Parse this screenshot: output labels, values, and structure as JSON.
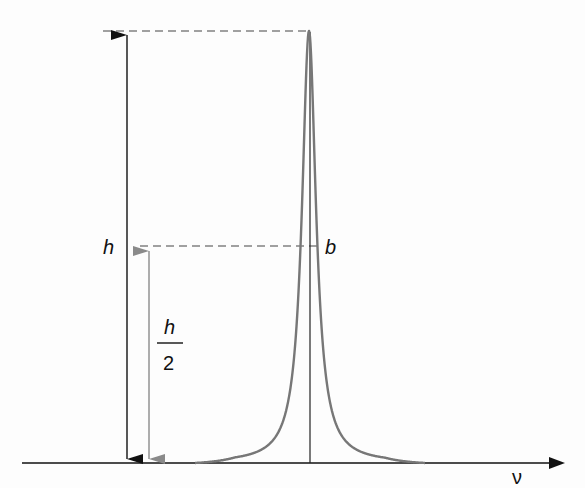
{
  "diagram": {
    "labels": {
      "height": "h",
      "half_height_numerator": "h",
      "half_height_denominator": "2",
      "half_width": "b",
      "x_axis": "ν"
    },
    "colors": {
      "axis": "#111111",
      "curve": "#777777",
      "height_arrow": "#111111",
      "half_height_arrow": "#8a8a8a",
      "dashed_lines": "#444444"
    },
    "geometry": {
      "baseline_y": 463,
      "axis_x_start": 22,
      "axis_x_end": 565,
      "peak_x": 309,
      "peak_y": 31,
      "half_y": 246,
      "half_width_px": 8.5,
      "curve_x_start": 195,
      "curve_x_end": 425,
      "height_arrow_x": 127,
      "half_arrow_x": 149,
      "top_dash_x_start": 103,
      "half_dash_x_start": 140
    }
  }
}
